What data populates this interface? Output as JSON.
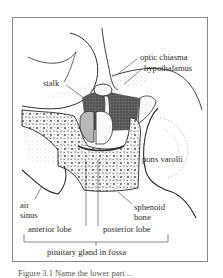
{
  "figure": {
    "type": "anatomical cross-section",
    "subject": "pituitary gland in fossa",
    "labels": {
      "optic_chiasma": "optic chiasma",
      "hypothalamus": "hypothalamus",
      "stalk": "stalk",
      "pons_varolii": "pons varolii",
      "air_sinus_line1": "air",
      "air_sinus_line2": "sinus",
      "sphenoid_line1": "sphenoid",
      "sphenoid_line2": "bone",
      "anterior_lobe": "anterior lobe",
      "posterior_lobe": "posterior lobe",
      "pituitary": "pituitary gland in fossa"
    },
    "caption": "Figure 3.1  Name the lower part ...",
    "colors": {
      "frame": "#8a8a8a",
      "ink": "#2a2a2a",
      "shading": "#6e6e6e",
      "gland_fill": "#b8b8b8",
      "background": "#ffffff"
    }
  }
}
